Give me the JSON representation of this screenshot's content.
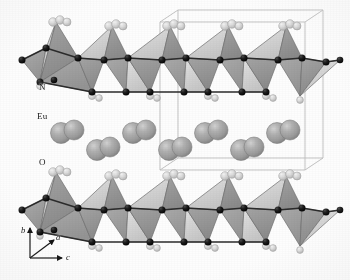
{
  "figure": {
    "kind": "crystal-structure-diagram",
    "background_color": "#fdfdfd"
  },
  "labels": {
    "nitrogen": "N",
    "europium": "Eu",
    "oxygen": "O"
  },
  "axes": {
    "b": "b",
    "a": "a",
    "c": "c",
    "origin": {
      "x": 30,
      "y": 258
    },
    "arrows": [
      {
        "name": "b",
        "dx": 0,
        "dy": -32,
        "label_x": 22,
        "label_y": 228
      },
      {
        "name": "a",
        "dx": 26,
        "dy": -20,
        "label_x": 60,
        "label_y": 236
      },
      {
        "name": "c",
        "dx": 34,
        "dy": 0,
        "label_x": 70,
        "label_y": 264
      }
    ]
  },
  "unit_cell": {
    "stroke": "#b9b9b9",
    "stroke_width": 0.9,
    "front": {
      "x": 160,
      "y": 22,
      "w": 145,
      "h": 148
    },
    "depth": {
      "dx": 18,
      "dy": -12
    }
  },
  "colors": {
    "tetra_face_dark": "#8f8f8f",
    "tetra_face_mid": "#9d9d9d",
    "tetra_face_light": "#cfcfcf",
    "tetra_face_lighter": "#dedede",
    "tetra_edge": "#6d6d6d",
    "nitrogen_sphere": "#141414",
    "nitrogen_rim": "#000000",
    "oxygen_sphere": "#d6d6d6",
    "oxygen_rim": "#9a9a9a",
    "europium_sphere": "#a2a2a2",
    "europium_highlight": "#c9c9c9",
    "europium_rim": "#7b7b7b",
    "bond": "#2a2a2a"
  },
  "layers": {
    "top_layer_y": 58,
    "bottom_layer_y": 208,
    "europium_row_upper_y": 133,
    "europium_row_lower_y": 150
  },
  "chain": {
    "period": 58,
    "start_x": 22,
    "count": 6
  },
  "europium_pairs": {
    "upper_row_x": [
      61,
      133,
      205,
      277
    ],
    "lower_row_x": [
      97,
      169,
      241
    ],
    "pair_offset": 13,
    "radius": 10.5
  }
}
